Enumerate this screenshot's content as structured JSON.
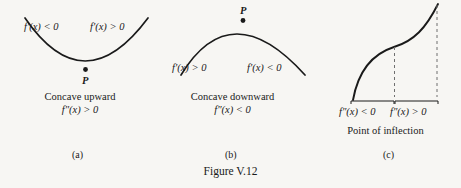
{
  "figure": {
    "caption": "Figure V.12",
    "background_color": "#f7f6f3",
    "ink_color": "#1a1a1a",
    "dash_color": "#6f6f6f"
  },
  "panels": [
    {
      "letter": "(a)",
      "curve_type": "concave-upward-parabola",
      "point_label": "P",
      "left_slope_label": "f'(x) < 0",
      "right_slope_label": "f'(x) > 0",
      "title": "Concave upward",
      "second_derivative": "f″(x) > 0"
    },
    {
      "letter": "(b)",
      "curve_type": "concave-downward-arch",
      "point_label": "P",
      "left_slope_label": "f'(x) > 0",
      "right_slope_label": "f'(x) < 0",
      "title": "Concave downward",
      "second_derivative": "f″(x) < 0"
    },
    {
      "letter": "(c)",
      "curve_type": "s-curve-with-inflection",
      "left_brace_label": "f″(x) < 0",
      "right_brace_label": "f″(x) > 0",
      "title": "Point of inflection"
    }
  ]
}
